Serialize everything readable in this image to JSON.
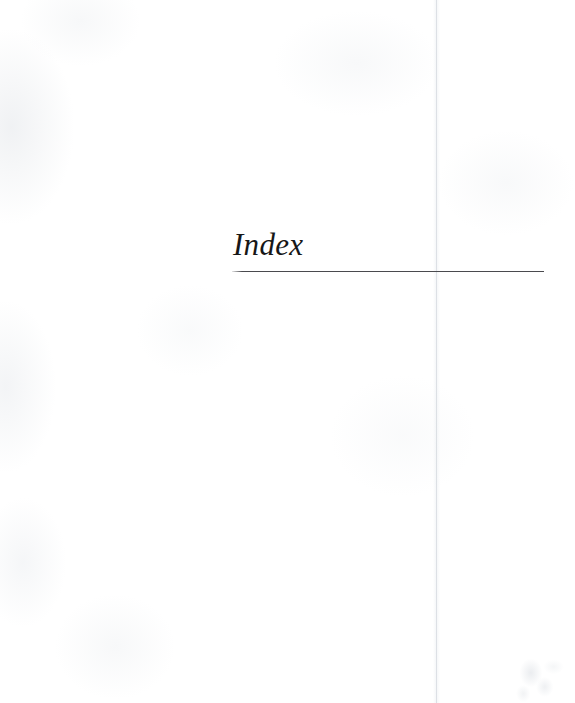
{
  "document": {
    "page_type": "index-divider-page",
    "background_color": "#ffffff"
  },
  "heading": {
    "title": "Index",
    "title_color": "#171717",
    "rule_color": "#4a4a4e"
  },
  "artifacts": {
    "gutter_line_color": "#cdd2d8",
    "smudge_label": "",
    "texture_label": ""
  }
}
